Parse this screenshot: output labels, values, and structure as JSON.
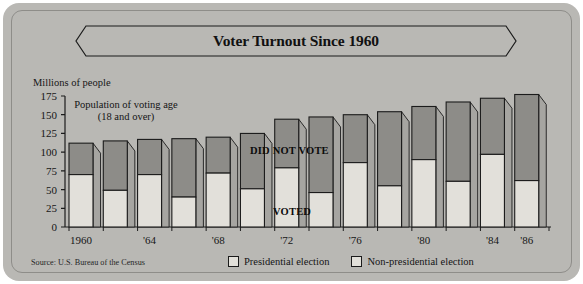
{
  "title": "Voter Turnout Since 1960",
  "axis": {
    "y_label": "Millions of people",
    "y_ticks": [
      0,
      25,
      50,
      75,
      100,
      125,
      150,
      175
    ],
    "x_tick_labels": [
      "1960",
      "'64",
      "'68",
      "'72",
      "'76",
      "'80",
      "'84",
      "'86"
    ]
  },
  "annotations": {
    "population_line1": "Population of voting age",
    "population_line2": "(18 and over)",
    "did_not_vote": "DID NOT VOTE",
    "voted": "VOTED"
  },
  "legend": {
    "presidential": "Presidential election",
    "non_presidential": "Non-presidential election"
  },
  "source": "Source: U.S. Bureau of the Census",
  "colors": {
    "background": "#b9b8b4",
    "voted_fill": "#e2e0da",
    "did_not_vote_fill": "#8d8c88",
    "outline": "#1b1b1b"
  },
  "chart_data": {
    "type": "bar",
    "title": "Voter Turnout Since 1960",
    "xlabel": "",
    "ylabel": "Millions of people",
    "ylim": [
      0,
      175
    ],
    "grid": false,
    "legend_position": "bottom",
    "stacked": true,
    "note": "Each bar is total voting-age population (18 and over), split into VOTED (light, bottom) and DID NOT VOTE (dark, top).",
    "categories": [
      "1960",
      "1962",
      "1964",
      "1966",
      "1968",
      "1970",
      "1972",
      "1974",
      "1976",
      "1978",
      "1980",
      "1982",
      "1984",
      "1986"
    ],
    "tick_labeled": [
      "1960",
      "",
      "'64",
      "",
      "'68",
      "",
      "'72",
      "",
      "'76",
      "",
      "'80",
      "",
      "'84",
      "'86"
    ],
    "election_type": [
      "presidential",
      "non-presidential",
      "presidential",
      "non-presidential",
      "presidential",
      "non-presidential",
      "presidential",
      "non-presidential",
      "presidential",
      "non-presidential",
      "presidential",
      "non-presidential",
      "presidential",
      "non-presidential"
    ],
    "series": [
      {
        "name": "VOTED",
        "values": [
          70,
          49,
          70,
          40,
          72,
          51,
          79,
          46,
          86,
          55,
          90,
          61,
          97,
          62
        ]
      },
      {
        "name": "DID NOT VOTE",
        "values": [
          42,
          66,
          47,
          78,
          48,
          74,
          65,
          101,
          64,
          99,
          71,
          106,
          75,
          115
        ]
      }
    ],
    "totals": [
      112,
      115,
      117,
      118,
      120,
      125,
      144,
      147,
      150,
      154,
      161,
      167,
      172,
      177
    ]
  }
}
